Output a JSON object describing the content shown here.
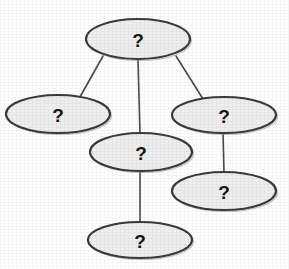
{
  "diagram": {
    "type": "node-link-graph",
    "title": "",
    "background_color": "#ffffff",
    "node_fill_color": "#efefef",
    "node_stroke_color": "#3b3b3b",
    "edge_color": "#4a4a4a",
    "label_color": "#161616",
    "node_shape": "ellipse",
    "node_count": 6,
    "edge_count": 5,
    "nodes": [
      {
        "id": "node-root",
        "label": "?",
        "cx": 138,
        "cy": 39,
        "rx": 52,
        "ry": 20
      },
      {
        "id": "node-left",
        "label": "?",
        "cx": 58,
        "cy": 114,
        "rx": 52,
        "ry": 19
      },
      {
        "id": "node-right",
        "label": "?",
        "cx": 224,
        "cy": 115,
        "rx": 52,
        "ry": 18
      },
      {
        "id": "node-middle",
        "label": "?",
        "cx": 141,
        "cy": 152,
        "rx": 51,
        "ry": 19
      },
      {
        "id": "node-lower-right",
        "label": "?",
        "cx": 224,
        "cy": 191,
        "rx": 52,
        "ry": 19
      },
      {
        "id": "node-bottom",
        "label": "?",
        "cx": 140,
        "cy": 240,
        "rx": 52,
        "ry": 18
      }
    ],
    "edges": [
      {
        "id": "edge-root-left",
        "from": "node-root",
        "to": "node-left",
        "x1": 103,
        "y1": 56,
        "x2": 80,
        "y2": 97
      },
      {
        "id": "edge-root-middle",
        "from": "node-root",
        "to": "node-middle",
        "x1": 138,
        "y1": 59,
        "x2": 140,
        "y2": 134
      },
      {
        "id": "edge-root-right",
        "from": "node-root",
        "to": "node-right",
        "x1": 176,
        "y1": 56,
        "x2": 203,
        "y2": 99
      },
      {
        "id": "edge-right-lower-right",
        "from": "node-right",
        "to": "node-lower-right",
        "x1": 223,
        "y1": 132,
        "x2": 224,
        "y2": 173
      },
      {
        "id": "edge-middle-bottom",
        "from": "node-middle",
        "to": "node-bottom",
        "x1": 140,
        "y1": 171,
        "x2": 140,
        "y2": 223
      }
    ]
  }
}
